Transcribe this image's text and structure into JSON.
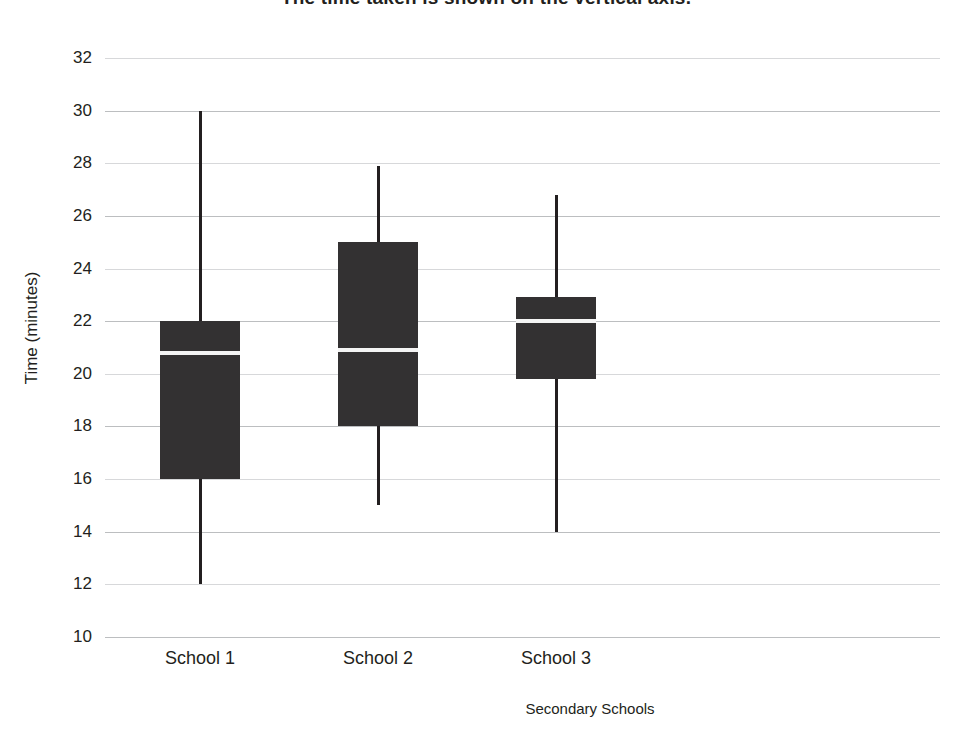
{
  "chart_data": {
    "type": "box",
    "title": "The time taken is shown on the vertical axis.",
    "xlabel": "Secondary Schools",
    "ylabel": "Time (minutes)",
    "categories": [
      "School 1",
      "School 2",
      "School 3"
    ],
    "ylim": [
      10,
      32
    ],
    "yticks": [
      32,
      30,
      28,
      26,
      24,
      22,
      20,
      18,
      16,
      14,
      12,
      10
    ],
    "grid": true,
    "legend": "none",
    "series": [
      {
        "name": "School 1",
        "min": 12,
        "q1": 16,
        "median": 20.8,
        "q3": 22,
        "max": 30
      },
      {
        "name": "School 2",
        "min": 15,
        "q1": 18,
        "median": 20.9,
        "q3": 25,
        "max": 27.9
      },
      {
        "name": "School 3",
        "min": 14,
        "q1": 19.8,
        "median": 22,
        "q3": 22.9,
        "max": 26.8
      }
    ],
    "colors": {
      "box_fill": "#333132",
      "median": "#f4f4f4",
      "whisker": "#231f20",
      "gridline": "#bcbec0",
      "text": "#231f20",
      "background": "#ffffff"
    }
  }
}
